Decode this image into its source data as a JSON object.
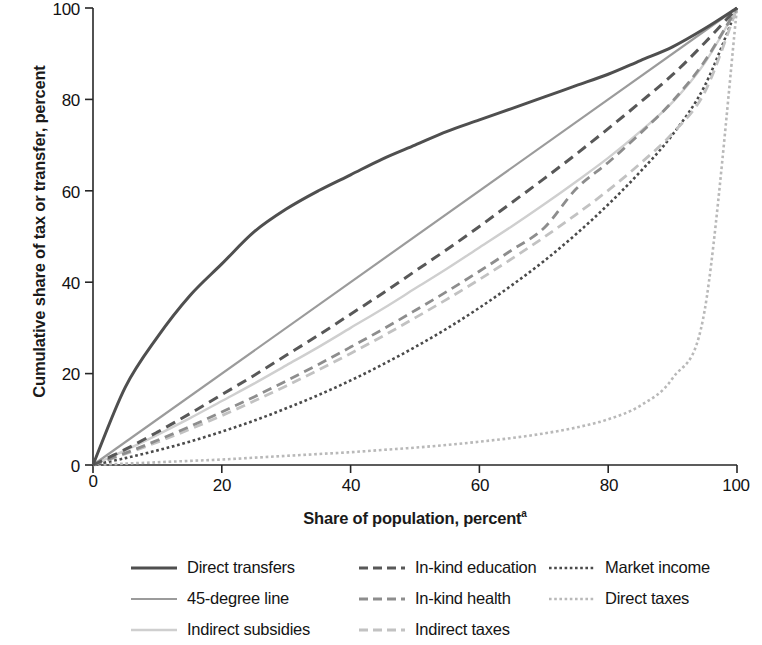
{
  "axes": {
    "ylabel": "Cumulative share of tax or transfer, percent",
    "xlabel": "Share of population, percent",
    "xlabel_superscript": "a",
    "xticks": [
      "0",
      "20",
      "40",
      "60",
      "80",
      "100"
    ],
    "yticks": [
      "0",
      "20",
      "40",
      "60",
      "80",
      "100"
    ]
  },
  "legend": {
    "items": [
      {
        "label": "Direct transfers",
        "style": "solid",
        "color": "#4f4f4f",
        "width": 3.0
      },
      {
        "label": "In-kind education",
        "style": "dash",
        "color": "#585858",
        "width": 3.0
      },
      {
        "label": "Market income",
        "style": "dot",
        "color": "#4a4a4a",
        "width": 2.6
      },
      {
        "label": "45-degree line",
        "style": "solid",
        "color": "#9b9b9b",
        "width": 2.2
      },
      {
        "label": "In-kind health",
        "style": "dash",
        "color": "#8d8d8d",
        "width": 2.8
      },
      {
        "label": "Direct taxes",
        "style": "dot",
        "color": "#b9b9b9",
        "width": 2.6
      },
      {
        "label": "Indirect subsidies",
        "style": "solid",
        "color": "#cfcfcf",
        "width": 2.4
      },
      {
        "label": "Indirect taxes",
        "style": "dash",
        "color": "#c2c2c2",
        "width": 2.8
      }
    ]
  },
  "chart_data": {
    "type": "line",
    "title": "",
    "xlabel": "Share of population, percent",
    "ylabel": "Cumulative share of tax or transfer, percent",
    "xlim": [
      0,
      100
    ],
    "ylim": [
      0,
      100
    ],
    "grid": false,
    "legend_position": "below",
    "x": [
      0,
      5,
      10,
      15,
      20,
      25,
      30,
      35,
      40,
      45,
      50,
      55,
      60,
      65,
      70,
      75,
      80,
      85,
      90,
      95,
      100
    ],
    "series": [
      {
        "name": "Direct transfers",
        "values": [
          0,
          17,
          28,
          37,
          44,
          51,
          56,
          60,
          63.5,
          67,
          70,
          73,
          75.5,
          78,
          80.5,
          83,
          85.5,
          88.5,
          91.5,
          95.5,
          100
        ]
      },
      {
        "name": "45-degree line",
        "values": [
          0,
          5,
          10,
          15,
          20,
          25,
          30,
          35,
          40,
          45,
          50,
          55,
          60,
          65,
          70,
          75,
          80,
          85,
          90,
          95,
          100
        ]
      },
      {
        "name": "Indirect subsidies",
        "values": [
          0,
          3.2,
          6.6,
          10.2,
          14.0,
          17.8,
          21.8,
          25.8,
          30.0,
          34.2,
          38.6,
          43.0,
          47.6,
          52.2,
          57.0,
          62.0,
          67.2,
          73.0,
          79.4,
          88.0,
          100
        ]
      },
      {
        "name": "In-kind education",
        "values": [
          0,
          3.4,
          7.2,
          11.2,
          15.4,
          19.6,
          24.0,
          28.4,
          33.0,
          37.6,
          42.4,
          47.2,
          52.2,
          57.4,
          62.6,
          68.0,
          73.6,
          79.4,
          85.4,
          92.4,
          100
        ]
      },
      {
        "name": "In-kind health",
        "values": [
          0,
          2.6,
          5.4,
          8.4,
          11.6,
          14.9,
          18.4,
          22.0,
          25.8,
          29.7,
          33.8,
          38.0,
          42.4,
          47.0,
          51.8,
          60.4,
          66.2,
          72.6,
          79.6,
          88.4,
          100
        ]
      },
      {
        "name": "Indirect taxes",
        "values": [
          0,
          2.4,
          5.0,
          7.8,
          10.8,
          14.0,
          17.3,
          20.8,
          24.4,
          28.2,
          32.2,
          36.3,
          40.6,
          45.1,
          49.8,
          54.8,
          60.1,
          66.0,
          72.6,
          81.6,
          100
        ]
      },
      {
        "name": "Market income",
        "values": [
          0,
          1.5,
          3.2,
          5.1,
          7.3,
          9.7,
          12.4,
          15.3,
          18.5,
          22.0,
          25.8,
          29.9,
          34.4,
          39.3,
          44.6,
          50.5,
          57.0,
          64.2,
          72.3,
          83.0,
          100
        ]
      },
      {
        "name": "Direct taxes",
        "values": [
          0,
          0.3,
          0.6,
          0.9,
          1.2,
          1.6,
          2.0,
          2.4,
          2.8,
          3.3,
          3.8,
          4.4,
          5.1,
          5.9,
          6.9,
          8.2,
          10.0,
          13.0,
          19.0,
          34.0,
          100
        ]
      }
    ]
  }
}
